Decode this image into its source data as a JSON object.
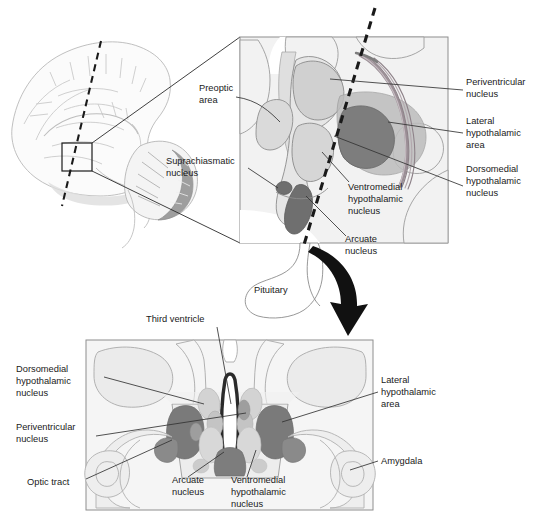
{
  "figure": {
    "title_visible": false,
    "background_color": "#ffffff",
    "panels": [
      {
        "id": "sagittal-overview",
        "type": "brain-sagittal-outline",
        "description": "Mid-sagittal brain outline with small box marking hypothalamus and dashed coronal plane line"
      },
      {
        "id": "sagittal-inset",
        "type": "hypothalamus-sagittal-detail",
        "description": "Magnified sagittal view of hypothalamic nuclei with dashed coronal plane"
      },
      {
        "id": "coronal-section",
        "type": "hypothalamus-coronal-section",
        "description": "Coronal section through hypothalamus showing bilateral nuclei"
      }
    ]
  },
  "colors": {
    "outline": "#6e6e6e",
    "outline_light": "#9a9a9a",
    "tissue_fill": "#f0f0f0",
    "nucleus_dark": "#7d7d7d",
    "nucleus_mid": "#a8a8a8",
    "nucleus_light": "#c9c9c9",
    "nucleus_pale": "#dcdcdc",
    "dashed_plane": "#1a1a1a",
    "arrow": "#111111",
    "leader_line": "#333333",
    "text": "#1a1a1a",
    "panel_border": "#808080"
  },
  "sagittal_inset": {
    "labels": [
      {
        "id": "preoptic-area",
        "lines": [
          "Preoptic",
          "area"
        ],
        "x": 199,
        "y": 91,
        "anchor": "start"
      },
      {
        "id": "suprachiasmatic-nucleus",
        "lines": [
          "Suprachiasmatic",
          "nucleus"
        ],
        "x": 166,
        "y": 164,
        "anchor": "start"
      },
      {
        "id": "periventricular-nucleus",
        "lines": [
          "Periventricular",
          "nucleus"
        ],
        "x": 466,
        "y": 85,
        "anchor": "start"
      },
      {
        "id": "lateral-hypothalamic-area",
        "lines": [
          "Lateral",
          "hypothalamic",
          "area"
        ],
        "x": 466,
        "y": 124,
        "anchor": "start"
      },
      {
        "id": "dorsomedial-hypothalamic-nucleus",
        "lines": [
          "Dorsomedial",
          "hypothalamic",
          "nucleus"
        ],
        "x": 466,
        "y": 172,
        "anchor": "start"
      },
      {
        "id": "ventromedial-hypothalamic-nucleus",
        "lines": [
          "Ventromedial",
          "hypothalamic",
          "nucleus"
        ],
        "x": 348,
        "y": 190,
        "anchor": "start"
      },
      {
        "id": "arcuate-nucleus",
        "lines": [
          "Arcuate",
          "nucleus"
        ],
        "x": 345,
        "y": 242,
        "anchor": "start"
      },
      {
        "id": "pituitary",
        "lines": [
          "Pituitary"
        ],
        "x": 254,
        "y": 293,
        "anchor": "start"
      }
    ]
  },
  "coronal_section": {
    "labels": [
      {
        "id": "third-ventricle",
        "lines": [
          "Third ventricle"
        ],
        "x": 146,
        "y": 322,
        "anchor": "start"
      },
      {
        "id": "dorsomedial-hypothalamic-nucleus",
        "lines": [
          "Dorsomedial",
          "hypothalamic",
          "nucleus"
        ],
        "x": 16,
        "y": 372,
        "anchor": "start"
      },
      {
        "id": "periventricular-nucleus",
        "lines": [
          "Periventricular",
          "nucleus"
        ],
        "x": 16,
        "y": 430,
        "anchor": "start"
      },
      {
        "id": "optic-tract",
        "lines": [
          "Optic tract"
        ],
        "x": 27,
        "y": 485,
        "anchor": "start"
      },
      {
        "id": "arcuate-nucleus",
        "lines": [
          "Arcuate",
          "nucleus"
        ],
        "x": 172,
        "y": 483,
        "anchor": "start"
      },
      {
        "id": "ventromedial-hypothalamic-nucleus",
        "lines": [
          "Ventromedial",
          "hypothalamic",
          "nucleus"
        ],
        "x": 231,
        "y": 483,
        "anchor": "start"
      },
      {
        "id": "lateral-hypothalamic-area",
        "lines": [
          "Lateral",
          "hypothalamic",
          "area"
        ],
        "x": 381,
        "y": 383,
        "anchor": "start"
      },
      {
        "id": "amygdala",
        "lines": [
          "Amygdala"
        ],
        "x": 381,
        "y": 464,
        "anchor": "start"
      }
    ]
  },
  "structures": {
    "sagittal": [
      "preoptic area",
      "suprachiasmatic nucleus",
      "periventricular nucleus",
      "lateral hypothalamic area",
      "dorsomedial hypothalamic nucleus",
      "ventromedial hypothalamic nucleus",
      "arcuate nucleus",
      "pituitary",
      "fornix"
    ],
    "coronal": [
      "third ventricle",
      "dorsomedial hypothalamic nucleus",
      "periventricular nucleus",
      "optic tract",
      "arcuate nucleus",
      "ventromedial hypothalamic nucleus",
      "lateral hypothalamic area",
      "amygdala"
    ]
  }
}
